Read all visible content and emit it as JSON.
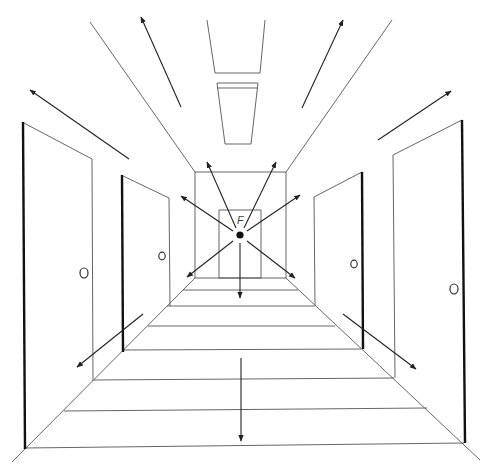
{
  "figure": {
    "vanishing_point_label": "F",
    "colors": {
      "line": "#555555",
      "heavy_edge": "#111111",
      "background": "#ffffff"
    },
    "doors": [
      {
        "side": "left",
        "position": "near"
      },
      {
        "side": "left",
        "position": "far"
      },
      {
        "side": "right",
        "position": "far"
      },
      {
        "side": "right",
        "position": "near"
      },
      {
        "side": "back",
        "position": "end-wall"
      }
    ],
    "ceiling_lights": 2,
    "floor_boards": 7,
    "arrows_from_vanishing_point": 7,
    "arrows_toward_viewer": 7
  }
}
